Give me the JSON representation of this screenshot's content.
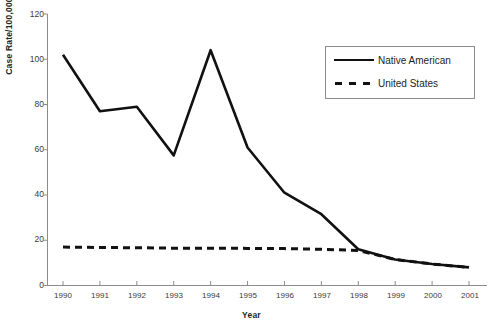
{
  "chart_data": {
    "type": "line",
    "title": "",
    "xlabel": "Year",
    "ylabel": "Case Rate/100,000",
    "categories": [
      "1990",
      "1991",
      "1992",
      "1993",
      "1994",
      "1995",
      "1996",
      "1997",
      "1998",
      "1999",
      "2000",
      "2001"
    ],
    "x": [
      1990,
      1991,
      1992,
      1993,
      1994,
      1995,
      1996,
      1997,
      1998,
      1999,
      2000,
      2001
    ],
    "xlim": [
      1990,
      2001
    ],
    "ylim": [
      0,
      120
    ],
    "yticks": [
      0,
      20,
      40,
      60,
      80,
      100,
      120
    ],
    "grid": false,
    "legend_position": "top-right",
    "series": [
      {
        "name": "Native American",
        "style": "solid",
        "color": "#111111",
        "values": [
          102.0,
          77.0,
          79.0,
          57.5,
          104.0,
          61.0,
          41.0,
          31.5,
          16.0,
          11.5,
          9.5,
          8.0
        ]
      },
      {
        "name": "United States",
        "style": "dashed",
        "color": "#111111",
        "values": [
          17.0,
          16.8,
          16.7,
          16.5,
          16.5,
          16.4,
          16.3,
          16.0,
          15.5,
          11.5,
          9.5,
          8.0
        ]
      }
    ]
  },
  "axes": {
    "y_title": "Case Rate/100,000",
    "x_title": "Year",
    "y_tick_labels": [
      "120",
      "100",
      "80",
      "60",
      "40",
      "20",
      "0"
    ],
    "x_tick_labels": [
      "1990",
      "1991",
      "1992",
      "1993",
      "1994",
      "1995",
      "1996",
      "1997",
      "1998",
      "1999",
      "2000",
      "2001"
    ]
  },
  "legend": {
    "entries": [
      {
        "label": "Native American",
        "marker": "solid-line-icon"
      },
      {
        "label": "United States",
        "marker": "dashed-line-icon"
      }
    ]
  },
  "colors": {
    "line": "#111111",
    "axis": "#8c8c8c",
    "text": "#2b2b2b",
    "background": "#ffffff"
  },
  "caption": {
    "fragment": ""
  }
}
